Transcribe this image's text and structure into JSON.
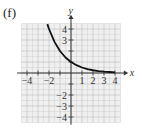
{
  "panel_label": "(f)",
  "chart_data": {
    "type": "line",
    "title": "",
    "xlabel": "x",
    "ylabel": "y",
    "xlim": [
      -4.5,
      4.5
    ],
    "ylim": [
      -4.5,
      4.5
    ],
    "grid": true,
    "x_ticks": [
      -4,
      -2,
      1,
      2,
      3,
      4
    ],
    "y_ticks": [
      -4,
      -3,
      -2,
      3,
      4
    ],
    "x_tick_labels": [
      "−4",
      "−2",
      "1",
      "2",
      "3",
      "4"
    ],
    "y_tick_labels": [
      "−4",
      "−3",
      "−2",
      "3",
      "4"
    ],
    "series": [
      {
        "name": "y = 2^(-x)",
        "x": [
          -2.15,
          -2,
          -1.5,
          -1,
          -0.5,
          0,
          0.5,
          1,
          1.5,
          2,
          2.5,
          3,
          3.5,
          4
        ],
        "y": [
          4.44,
          4,
          2.83,
          2,
          1.41,
          1,
          0.71,
          0.5,
          0.35,
          0.25,
          0.18,
          0.125,
          0.09,
          0.06
        ]
      }
    ]
  },
  "colors": {
    "curve": "#111111",
    "axis": "#333333",
    "grid": "#c8c8c8",
    "grid_bg": "#f0f0f0"
  }
}
